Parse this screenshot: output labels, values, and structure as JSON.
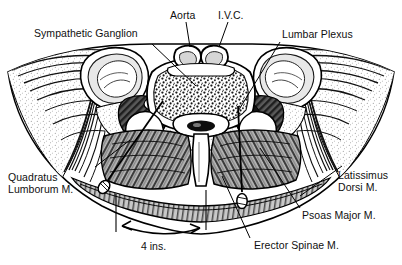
{
  "figure": {
    "background_color": "#ffffff",
    "ink_color": "#000000",
    "width": 402,
    "height": 265
  },
  "labels": {
    "sympathetic_ganglion": "Sympathetic Ganglion",
    "aorta": "Aorta",
    "ivc": "I.V.C.",
    "lumbar_plexus": "Lumbar Plexus",
    "quadratus_lumborum_line1": "Quadratus",
    "quadratus_lumborum_line2": "Lumborum M.",
    "latissimus_line1": "Latissimus",
    "latissimus_line2": "Dorsi M.",
    "psoas_major": "Psoas Major M.",
    "erector_spinae": "Erector Spinae M."
  },
  "scale": {
    "value": "4 ins."
  },
  "structures": {
    "vertebral_body": "vertebral-body",
    "spinal_canal": "spinal-canal",
    "spinous_process": "spinous-process",
    "transverse_process": "transverse-process",
    "kidney_left": "kidney-left",
    "kidney_right": "kidney-right",
    "erector_spinae_muscle": "erector-spinae-muscle",
    "psoas_muscle": "psoas-muscle",
    "flank_muscle_layers": "flank-muscle-layers",
    "needle_left": "needle-left",
    "needle_right": "needle-right"
  }
}
